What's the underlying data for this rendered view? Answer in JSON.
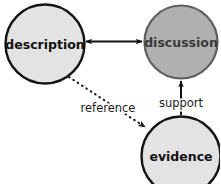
{
  "diagram": {
    "background_color": "#ffffff",
    "nodes": [
      {
        "id": "description",
        "label": "description",
        "fill": "#e3e3e3",
        "stroke": "#141414",
        "text_color": "#111111",
        "cx": 45,
        "cy": 44,
        "r": 40
      },
      {
        "id": "discussion",
        "label": "discussion",
        "fill": "#b0b0b0",
        "stroke": "#5a5a5a",
        "text_color": "#3a3a3a",
        "cx": 181,
        "cy": 42,
        "r": 37
      },
      {
        "id": "evidence",
        "label": "evidence",
        "fill": "#e3e3e3",
        "stroke": "#141414",
        "text_color": "#111111",
        "cx": 181,
        "cy": 156,
        "r": 40
      }
    ],
    "edges": [
      {
        "id": "description-discussion",
        "label": "",
        "style": "solid",
        "arrows": "both",
        "from": "description",
        "to": "discussion"
      },
      {
        "id": "description-evidence",
        "label": "reference",
        "style": "dotted",
        "arrows": "to",
        "from": "description",
        "to": "evidence"
      },
      {
        "id": "evidence-discussion",
        "label": "support",
        "style": "solid",
        "arrows": "to",
        "from": "evidence",
        "to": "discussion"
      }
    ]
  }
}
